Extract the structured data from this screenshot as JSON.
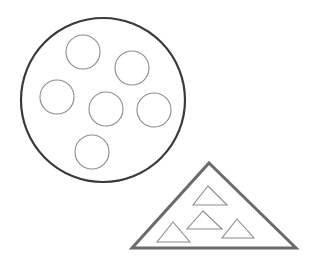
{
  "diagram": {
    "background": "#ffffff",
    "width": 311,
    "height": 262,
    "big_circle": {
      "cx": 103,
      "cy": 100,
      "r": 82,
      "stroke": "#3a3a3a",
      "stroke_width": 2.2,
      "contains_count": 6
    },
    "small_circles": [
      {
        "cx": 83,
        "cy": 52,
        "r": 17
      },
      {
        "cx": 132,
        "cy": 68,
        "r": 17
      },
      {
        "cx": 57,
        "cy": 97,
        "r": 17
      },
      {
        "cx": 106,
        "cy": 109,
        "r": 17
      },
      {
        "cx": 154,
        "cy": 110,
        "r": 17
      },
      {
        "cx": 92,
        "cy": 152,
        "r": 17
      }
    ],
    "small_circle_style": {
      "stroke": "#8c8c8c",
      "stroke_width": 1.1
    },
    "big_triangle": {
      "points": [
        [
          209,
          163
        ],
        [
          296,
          248
        ],
        [
          132,
          248
        ]
      ],
      "stroke": "#6b6b6b",
      "stroke_width": 3,
      "contains_count": 4
    },
    "small_triangles": [
      {
        "points": [
          [
            208,
            186
          ],
          [
            227,
            205
          ],
          [
            193,
            205
          ]
        ]
      },
      {
        "points": [
          [
            203,
            211
          ],
          [
            222,
            229
          ],
          [
            187,
            229
          ]
        ]
      },
      {
        "points": [
          [
            173,
            222
          ],
          [
            190,
            242
          ],
          [
            157,
            242
          ]
        ]
      },
      {
        "points": [
          [
            237,
            219
          ],
          [
            254,
            238
          ],
          [
            222,
            238
          ]
        ]
      }
    ],
    "small_triangle_style": {
      "stroke": "#8c8c8c",
      "stroke_width": 1.1
    }
  }
}
